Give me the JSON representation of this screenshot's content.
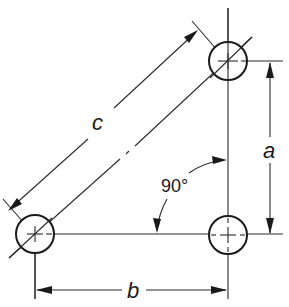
{
  "diagram": {
    "labels": {
      "hypotenuse": "c",
      "vertical": "a",
      "horizontal": "b",
      "angle": "90°"
    },
    "holes": [
      {
        "name": "top-right",
        "cx": 228,
        "cy": 61,
        "r": 19
      },
      {
        "name": "bottom-left",
        "cx": 35,
        "cy": 234,
        "r": 19
      },
      {
        "name": "bottom-right",
        "cx": 228,
        "cy": 235,
        "r": 19
      }
    ],
    "colors": {
      "line": "#2a2a2a",
      "background": "#ffffff"
    }
  }
}
